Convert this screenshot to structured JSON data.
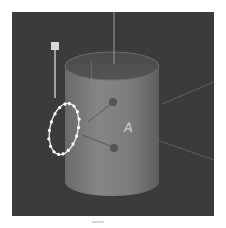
{
  "viewport": {
    "background": "#3b3b3b",
    "object": "cylinder",
    "cylinder_color": "#7a7a7a",
    "label": "A",
    "selection_ring": {
      "shape": "ellipse",
      "point_count": 18,
      "point_color": "#ffffff"
    },
    "handle": {
      "shape": "square",
      "color": "#d9d9d9"
    },
    "icons": {
      "top_axis": "axis-line",
      "handle": "move-handle",
      "ring": "rotation-ring",
      "pivot_upper": "pivot-dot",
      "pivot_lower": "pivot-dot"
    }
  }
}
